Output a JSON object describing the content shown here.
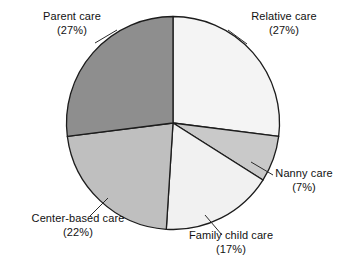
{
  "chart_data": {
    "type": "pie",
    "title": "",
    "subtitle": "",
    "xlabel": "",
    "ylabel": "",
    "legend_position": "none",
    "labels_position": "outside-with-leader-lines",
    "units": "percent",
    "start_angle_deg": 0,
    "direction": "clockwise",
    "categories": [
      "Relative care",
      "Nanny care",
      "Family child care",
      "Center-based care",
      "Parent care"
    ],
    "values": [
      27,
      7,
      17,
      22,
      27
    ],
    "slices": [
      {
        "label": "Relative care",
        "value": 27,
        "value_text": "(27%)",
        "color": "#f4f4f4",
        "start_deg": 0,
        "end_deg": 97.2
      },
      {
        "label": "Nanny care",
        "value": 7,
        "value_text": "(7%)",
        "color": "#c9c9c9",
        "start_deg": 97.2,
        "end_deg": 122.4
      },
      {
        "label": "Family child care",
        "value": 17,
        "value_text": "(17%)",
        "color": "#f1f1f1",
        "start_deg": 122.4,
        "end_deg": 183.6
      },
      {
        "label": "Center-based care",
        "value": 22,
        "value_text": "(22%)",
        "color": "#bfbfbf",
        "start_deg": 183.6,
        "end_deg": 262.8
      },
      {
        "label": "Parent care",
        "value": 27,
        "value_text": "(27%)",
        "color": "#8e8e8e",
        "start_deg": 262.8,
        "end_deg": 360
      }
    ],
    "outline_color": "#1c1c1c",
    "background_color": "#ffffff"
  },
  "labels": {
    "parent": {
      "name": "Parent care",
      "pct": "(27%)"
    },
    "relative": {
      "name": "Relative care",
      "pct": "(27%)"
    },
    "nanny": {
      "name": "Nanny care",
      "pct": "(7%)"
    },
    "family": {
      "name": "Family child care",
      "pct": "(17%)"
    },
    "center": {
      "name": "Center-based care",
      "pct": "(22%)"
    }
  }
}
